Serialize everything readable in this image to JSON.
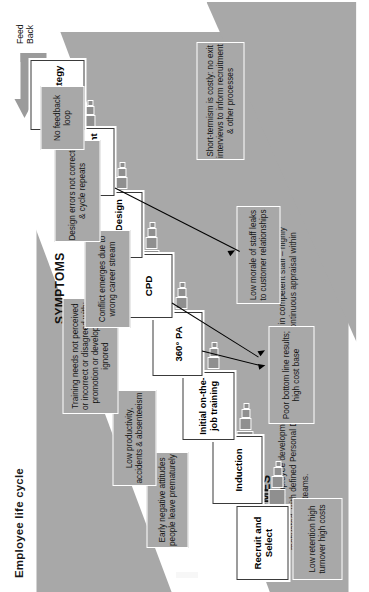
{
  "title": "Employee life cycle",
  "sections": {
    "symptoms_label": "SYMPTOMS",
    "outcomes_label": "OUTCOMES",
    "outcomes_body": "If you get the employee development process right, it results in competent staff – highly motivated, with defined Personal Development Plans from continuous appraisal within self-checking teams."
  },
  "feedback": {
    "label": "Feed\nBack",
    "line1": "Feed",
    "line2": "Back"
  },
  "process_steps": [
    {
      "label": "Recruit and Select"
    },
    {
      "label": "Induction"
    },
    {
      "label": "Initial on-the-job training"
    },
    {
      "label": "360° PA"
    },
    {
      "label": "CPD"
    },
    {
      "label": "Job Design"
    },
    {
      "label": "Problem Management"
    },
    {
      "label": "Exit Strategy"
    }
  ],
  "symptoms": [
    {
      "label": "Low retention high turnover high costs"
    },
    {
      "label": "Early negative attitudes people leave prematurely"
    },
    {
      "label": "Low productivity, accidents & absenteeism"
    },
    {
      "label": "Training needs not perceived or incorrect or disagreed with; promotion or development ignored"
    },
    {
      "label": "Conflict emerges due to wrong career stream"
    },
    {
      "label": "Design errors not corrected & cycle repeats"
    },
    {
      "label": "No feedback loop"
    },
    {
      "label": "Poor bottom line results; high cost base"
    },
    {
      "label": "Low morale of staff leaks to customer relationships"
    },
    {
      "label": "Short-termism is costly: no exit interviews to inform recruitment & other processes"
    }
  ],
  "colors": {
    "panel_grey": "#a8a8a8",
    "band_white": "#ffffff",
    "connector_grey": "#8f8f8f",
    "feedback_grey": "#9b9b9b",
    "text_dark": "#141414"
  }
}
